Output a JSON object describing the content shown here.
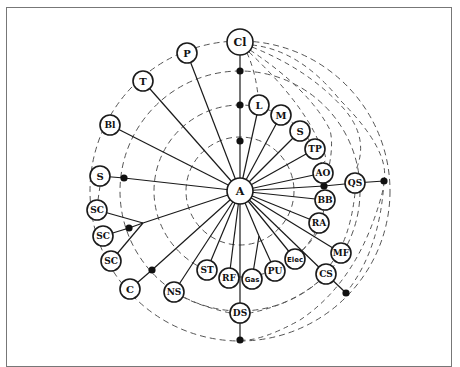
{
  "diagram": {
    "center": {
      "id": "A",
      "label": "A",
      "x": 240,
      "y": 191,
      "r": 13
    },
    "rings": [
      {
        "r": 150,
        "style": "dashed"
      },
      {
        "r": 120,
        "style": "dashed"
      },
      {
        "r": 86,
        "style": "dashed"
      },
      {
        "r": 54,
        "style": "dashed"
      }
    ],
    "nodes": [
      {
        "id": "Cl",
        "label": "Cl",
        "x": 240,
        "y": 42,
        "r": 13
      },
      {
        "id": "P",
        "label": "P",
        "x": 187,
        "y": 53,
        "r": 10
      },
      {
        "id": "T",
        "label": "T",
        "x": 143,
        "y": 81,
        "r": 10
      },
      {
        "id": "Bl",
        "label": "Bl",
        "x": 110,
        "y": 125,
        "r": 10
      },
      {
        "id": "S_left",
        "label": "S",
        "x": 100,
        "y": 176,
        "r": 10
      },
      {
        "id": "SC1",
        "label": "SC",
        "x": 97,
        "y": 210,
        "r": 10
      },
      {
        "id": "SC2",
        "label": "SC",
        "x": 103,
        "y": 236,
        "r": 10
      },
      {
        "id": "SC3",
        "label": "SC",
        "x": 111,
        "y": 261,
        "r": 10
      },
      {
        "id": "C",
        "label": "C",
        "x": 130,
        "y": 289,
        "r": 10
      },
      {
        "id": "NS",
        "label": "NS",
        "x": 174,
        "y": 292,
        "r": 10
      },
      {
        "id": "ST",
        "label": "ST",
        "x": 207,
        "y": 270,
        "r": 10
      },
      {
        "id": "RF",
        "label": "RF",
        "x": 229,
        "y": 278,
        "r": 10
      },
      {
        "id": "Gas",
        "label": "Gas",
        "x": 252,
        "y": 279,
        "r": 10,
        "small": true
      },
      {
        "id": "PU",
        "label": "PU",
        "x": 275,
        "y": 271,
        "r": 10
      },
      {
        "id": "Elec",
        "label": "Elec",
        "x": 295,
        "y": 259,
        "r": 10,
        "small": true
      },
      {
        "id": "DS",
        "label": "DS",
        "x": 240,
        "y": 313,
        "r": 10
      },
      {
        "id": "CS",
        "label": "CS",
        "x": 326,
        "y": 274,
        "r": 10
      },
      {
        "id": "MF",
        "label": "MF",
        "x": 341,
        "y": 253,
        "r": 10
      },
      {
        "id": "RA",
        "label": "RA",
        "x": 319,
        "y": 223,
        "r": 10
      },
      {
        "id": "BB",
        "label": "BB",
        "x": 325,
        "y": 200,
        "r": 10
      },
      {
        "id": "QS",
        "label": "QS",
        "x": 355,
        "y": 183,
        "r": 10
      },
      {
        "id": "AO",
        "label": "AO",
        "x": 323,
        "y": 173,
        "r": 10
      },
      {
        "id": "TP",
        "label": "TP",
        "x": 315,
        "y": 149,
        "r": 10
      },
      {
        "id": "S_right",
        "label": "S",
        "x": 300,
        "y": 131,
        "r": 10
      },
      {
        "id": "M",
        "label": "M",
        "x": 281,
        "y": 115,
        "r": 10
      },
      {
        "id": "L",
        "label": "L",
        "x": 259,
        "y": 105,
        "r": 10
      }
    ],
    "junctions": [
      {
        "id": "j_cl1",
        "x": 240,
        "y": 71
      },
      {
        "id": "j_cl2",
        "x": 240,
        "y": 105
      },
      {
        "id": "j_cl3",
        "x": 240,
        "y": 141
      },
      {
        "id": "j_s",
        "x": 124,
        "y": 178
      },
      {
        "id": "j_sc",
        "x": 129,
        "y": 228
      },
      {
        "id": "j_c",
        "x": 152,
        "y": 270
      },
      {
        "id": "j_ds",
        "x": 240,
        "y": 340
      },
      {
        "id": "j_cs",
        "x": 346,
        "y": 293
      },
      {
        "id": "j_qs",
        "x": 384,
        "y": 181
      },
      {
        "id": "j_bb",
        "x": 324,
        "y": 186
      }
    ],
    "spokes": [
      "P",
      "T",
      "Bl",
      "L",
      "M",
      "S_right",
      "TP",
      "AO",
      "BB",
      "RA",
      "MF",
      "CS",
      "Elec",
      "ST",
      "RF",
      "NS",
      "DS"
    ],
    "colors": {
      "line": "#1a1a1a",
      "dashed": "#555555",
      "node_fill": "#ffffff",
      "frame": "#777777"
    }
  }
}
